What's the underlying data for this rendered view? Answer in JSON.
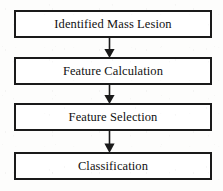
{
  "diagram": {
    "orientation": "vertical-top-to-bottom",
    "colors": {
      "border": "#1a1a1a",
      "node_fill": "#ffffff",
      "background": "#fdfdfc",
      "text": "#111111",
      "arrow": "#1a1a1a"
    },
    "nodes": [
      {
        "id": "identified-mass-lesion",
        "label": "Identified Mass Lesion",
        "shape": "rectangle"
      },
      {
        "id": "feature-calculation",
        "label": "Feature Calculation",
        "shape": "rectangle"
      },
      {
        "id": "feature-selection",
        "label": "Feature Selection",
        "shape": "rectangle"
      },
      {
        "id": "classification",
        "label": "Classification",
        "shape": "rectangle"
      }
    ],
    "connectors": [
      {
        "id": "arrow-1",
        "from": "identified-mass-lesion",
        "to": "feature-calculation",
        "icon": "down-arrow-icon"
      },
      {
        "id": "arrow-2",
        "from": "feature-calculation",
        "to": "feature-selection",
        "icon": "down-arrow-icon"
      },
      {
        "id": "arrow-3",
        "from": "feature-selection",
        "to": "classification",
        "icon": "down-arrow-icon"
      }
    ]
  }
}
